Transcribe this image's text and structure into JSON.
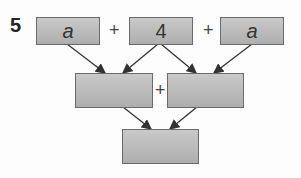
{
  "problem_number": "5",
  "top_row": [
    {
      "value": "a",
      "italic": true
    },
    {
      "value": "4",
      "italic": false
    },
    {
      "value": "a",
      "italic": true
    }
  ],
  "operators": {
    "top_1": "+",
    "top_2": "+",
    "middle": "+"
  },
  "middle_row": [
    {
      "value": ""
    },
    {
      "value": ""
    }
  ],
  "bottom": {
    "value": ""
  },
  "colors": {
    "box_fill": "#b8b8b8",
    "box_border": "#6a6a6a",
    "arrow": "#333333"
  }
}
